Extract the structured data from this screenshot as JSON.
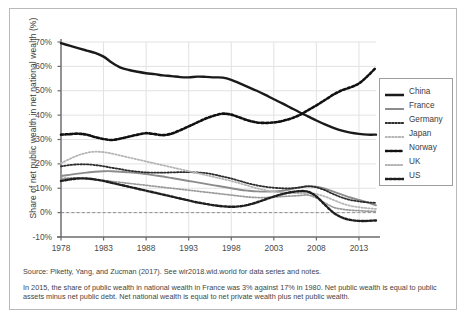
{
  "chart_data": {
    "type": "line",
    "title": "",
    "xlabel": "",
    "ylabel": "Share of net public wealth in net national wealth (%)",
    "xlim": [
      1978,
      2015
    ],
    "ylim": [
      -10,
      70
    ],
    "ytick_labels": [
      "70%",
      "60%",
      "50%",
      "40%",
      "30%",
      "20%",
      "10%",
      "0%",
      "-10%"
    ],
    "ytick_values": [
      70,
      60,
      50,
      40,
      30,
      20,
      10,
      0,
      -10
    ],
    "xtick_labels": [
      "1978",
      "1983",
      "1988",
      "1993",
      "1998",
      "2003",
      "2008",
      "2013"
    ],
    "xtick_values": [
      1978,
      1983,
      1988,
      1993,
      1998,
      2003,
      2008,
      2013
    ],
    "grid": true,
    "legend_position": "right",
    "zero_reference_line": 0,
    "x": [
      1978,
      1979,
      1980,
      1981,
      1982,
      1983,
      1984,
      1985,
      1986,
      1987,
      1988,
      1989,
      1990,
      1991,
      1992,
      1993,
      1994,
      1995,
      1996,
      1997,
      1998,
      1999,
      2000,
      2001,
      2002,
      2003,
      2004,
      2005,
      2006,
      2007,
      2008,
      2009,
      2010,
      2011,
      2012,
      2013,
      2014,
      2015
    ],
    "series": [
      {
        "name": "China",
        "style": "solid",
        "color": "#1a1a1a",
        "width": 2.4,
        "values": [
          69.5,
          68.5,
          67.5,
          66.5,
          65.5,
          64.0,
          61.5,
          59.5,
          58.5,
          57.8,
          57.2,
          56.8,
          56.3,
          56.0,
          55.6,
          55.5,
          55.8,
          55.7,
          55.5,
          55.4,
          54.5,
          53.0,
          51.5,
          50.0,
          48.3,
          46.5,
          44.8,
          43.0,
          41.2,
          39.5,
          37.8,
          36.2,
          34.8,
          33.6,
          32.8,
          32.3,
          32.0,
          32.0
        ]
      },
      {
        "name": "France",
        "style": "solid",
        "color": "#8c8c8c",
        "width": 1.9,
        "values": [
          15.0,
          15.5,
          16.0,
          16.4,
          16.8,
          17.0,
          17.0,
          16.8,
          16.5,
          16.2,
          15.8,
          15.3,
          14.8,
          14.2,
          13.6,
          13.0,
          12.4,
          11.8,
          11.2,
          10.6,
          10.0,
          9.4,
          9.0,
          8.7,
          8.6,
          8.7,
          9.0,
          9.6,
          10.3,
          10.8,
          10.6,
          9.8,
          8.6,
          7.4,
          6.2,
          5.2,
          4.2,
          3.0
        ]
      },
      {
        "name": "Germany",
        "style": "dotted-small",
        "color": "#2b2b2b",
        "width": 1.8,
        "values": [
          19.0,
          19.5,
          19.8,
          19.8,
          19.5,
          19.0,
          18.4,
          17.8,
          17.2,
          16.8,
          16.5,
          16.4,
          16.4,
          16.5,
          16.6,
          16.6,
          16.5,
          16.2,
          15.6,
          14.8,
          14.0,
          13.0,
          12.0,
          11.2,
          10.6,
          10.2,
          10.0,
          10.0,
          10.3,
          10.8,
          10.4,
          9.2,
          7.6,
          6.2,
          5.2,
          4.6,
          4.2,
          4.0
        ]
      },
      {
        "name": "Japan",
        "style": "dotted-light",
        "color": "#b5b5b5",
        "width": 1.8,
        "values": [
          20.2,
          22.0,
          23.5,
          24.5,
          25.0,
          24.8,
          24.2,
          23.4,
          22.6,
          21.8,
          21.0,
          20.2,
          19.4,
          18.6,
          17.8,
          17.0,
          16.2,
          15.4,
          14.6,
          13.8,
          13.0,
          12.0,
          11.0,
          10.0,
          9.2,
          8.6,
          8.2,
          8.0,
          8.0,
          8.0,
          7.6,
          6.6,
          5.2,
          3.8,
          2.8,
          2.2,
          1.8,
          1.5
        ]
      },
      {
        "name": "Norway",
        "style": "dotted-bold",
        "color": "#111111",
        "width": 2.6,
        "values": [
          32.0,
          32.2,
          32.4,
          32.0,
          31.0,
          30.2,
          29.8,
          30.4,
          31.2,
          32.0,
          32.6,
          32.2,
          31.8,
          32.4,
          33.8,
          35.4,
          37.0,
          38.6,
          39.8,
          40.6,
          40.2,
          39.0,
          37.8,
          37.0,
          36.8,
          37.0,
          37.6,
          38.6,
          40.0,
          42.0,
          44.0,
          46.2,
          48.4,
          50.2,
          51.4,
          53.0,
          56.0,
          59.5
        ]
      },
      {
        "name": "UK",
        "style": "dotted-small",
        "color": "#9a9a9a",
        "width": 1.7,
        "values": [
          14.0,
          14.2,
          14.2,
          14.0,
          13.6,
          13.2,
          12.8,
          12.4,
          12.0,
          11.6,
          11.2,
          10.8,
          10.4,
          10.0,
          9.6,
          9.2,
          8.8,
          8.4,
          8.0,
          7.6,
          7.2,
          6.8,
          6.4,
          6.2,
          6.2,
          6.4,
          6.6,
          6.8,
          7.0,
          7.2,
          6.0,
          4.0,
          2.2,
          1.4,
          1.0,
          0.8,
          0.6,
          0.5
        ]
      },
      {
        "name": "US",
        "style": "dotted-bold",
        "color": "#1f1f1f",
        "width": 2.4,
        "values": [
          13.0,
          13.6,
          14.0,
          14.0,
          13.6,
          13.0,
          12.2,
          11.4,
          10.6,
          9.8,
          9.0,
          8.2,
          7.4,
          6.6,
          5.8,
          5.0,
          4.2,
          3.6,
          3.0,
          2.6,
          2.4,
          2.6,
          3.2,
          4.2,
          5.4,
          6.6,
          7.6,
          8.4,
          8.8,
          8.6,
          6.6,
          3.2,
          0.0,
          -2.0,
          -3.0,
          -3.4,
          -3.4,
          -3.2
        ]
      }
    ]
  },
  "legend": {
    "items": [
      {
        "label": "China"
      },
      {
        "label": "France"
      },
      {
        "label": "Germany"
      },
      {
        "label": "Japan"
      },
      {
        "label": "Norway"
      },
      {
        "label": "UK"
      },
      {
        "label": "US"
      }
    ]
  },
  "notes": {
    "source": "Source: Piketty, Yang, and Zucman (2017). See wir2018.wid.world for data series and notes.",
    "body": "In 2015, the share of public wealth in national wealth in France was 3% against 17% in 1980. Net public wealth is equal to public assets minus net public debt. Net national wealth is equal to net private wealth plus net public wealth."
  }
}
